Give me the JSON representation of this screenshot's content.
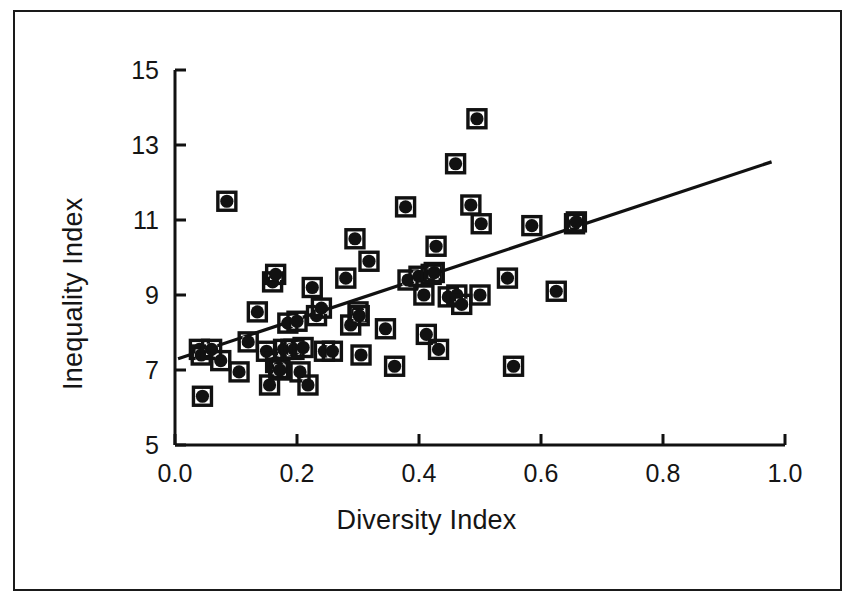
{
  "chart_data": {
    "type": "scatter",
    "title": "",
    "xlabel": "Diversity Index",
    "ylabel": "Inequality Index",
    "xlim": [
      0.0,
      1.0
    ],
    "ylim": [
      5,
      15
    ],
    "xticks": [
      "0.0",
      "0.2",
      "0.4",
      "0.6",
      "0.8",
      "1.0"
    ],
    "xtick_values": [
      0.0,
      0.2,
      0.4,
      0.6,
      0.8,
      1.0
    ],
    "yticks": [
      "5",
      "7",
      "9",
      "11",
      "13",
      "15"
    ],
    "ytick_values": [
      5,
      7,
      9,
      11,
      13,
      15
    ],
    "grid": false,
    "legend": null,
    "marker_style": "filled-circle-in-square",
    "marker_color": "#111111",
    "point_count": 62,
    "points": [
      {
        "x": 0.04,
        "y": 7.55
      },
      {
        "x": 0.043,
        "y": 7.4
      },
      {
        "x": 0.045,
        "y": 6.3
      },
      {
        "x": 0.06,
        "y": 7.55
      },
      {
        "x": 0.075,
        "y": 7.25
      },
      {
        "x": 0.085,
        "y": 11.5
      },
      {
        "x": 0.105,
        "y": 6.95
      },
      {
        "x": 0.12,
        "y": 7.75
      },
      {
        "x": 0.135,
        "y": 8.55
      },
      {
        "x": 0.15,
        "y": 7.5
      },
      {
        "x": 0.155,
        "y": 6.6
      },
      {
        "x": 0.16,
        "y": 9.35
      },
      {
        "x": 0.165,
        "y": 9.55
      },
      {
        "x": 0.165,
        "y": 7.2
      },
      {
        "x": 0.17,
        "y": 7.05
      },
      {
        "x": 0.172,
        "y": 7.0
      },
      {
        "x": 0.178,
        "y": 7.55
      },
      {
        "x": 0.185,
        "y": 8.25
      },
      {
        "x": 0.19,
        "y": 7.55
      },
      {
        "x": 0.195,
        "y": 7.55
      },
      {
        "x": 0.2,
        "y": 8.3
      },
      {
        "x": 0.205,
        "y": 6.95
      },
      {
        "x": 0.21,
        "y": 7.6
      },
      {
        "x": 0.218,
        "y": 6.6
      },
      {
        "x": 0.225,
        "y": 9.2
      },
      {
        "x": 0.232,
        "y": 8.45
      },
      {
        "x": 0.24,
        "y": 8.65
      },
      {
        "x": 0.245,
        "y": 7.5
      },
      {
        "x": 0.258,
        "y": 7.5
      },
      {
        "x": 0.28,
        "y": 9.45
      },
      {
        "x": 0.288,
        "y": 8.2
      },
      {
        "x": 0.295,
        "y": 10.5
      },
      {
        "x": 0.3,
        "y": 8.55
      },
      {
        "x": 0.302,
        "y": 8.45
      },
      {
        "x": 0.305,
        "y": 7.4
      },
      {
        "x": 0.318,
        "y": 9.9
      },
      {
        "x": 0.345,
        "y": 8.1
      },
      {
        "x": 0.36,
        "y": 7.1
      },
      {
        "x": 0.378,
        "y": 11.35
      },
      {
        "x": 0.382,
        "y": 9.4
      },
      {
        "x": 0.4,
        "y": 9.5
      },
      {
        "x": 0.408,
        "y": 9.0
      },
      {
        "x": 0.412,
        "y": 7.95
      },
      {
        "x": 0.42,
        "y": 9.55
      },
      {
        "x": 0.425,
        "y": 9.6
      },
      {
        "x": 0.428,
        "y": 10.3
      },
      {
        "x": 0.432,
        "y": 7.55
      },
      {
        "x": 0.448,
        "y": 8.95
      },
      {
        "x": 0.46,
        "y": 12.5
      },
      {
        "x": 0.462,
        "y": 9.0
      },
      {
        "x": 0.47,
        "y": 8.75
      },
      {
        "x": 0.485,
        "y": 11.4
      },
      {
        "x": 0.495,
        "y": 13.7
      },
      {
        "x": 0.5,
        "y": 9.0
      },
      {
        "x": 0.502,
        "y": 10.9
      },
      {
        "x": 0.545,
        "y": 9.45
      },
      {
        "x": 0.555,
        "y": 7.1
      },
      {
        "x": 0.585,
        "y": 10.85
      },
      {
        "x": 0.625,
        "y": 9.1
      },
      {
        "x": 0.655,
        "y": 10.9
      },
      {
        "x": 0.658,
        "y": 10.95
      }
    ],
    "trendline": {
      "type": "linear-fit",
      "x_start": 0.005,
      "y_start": 7.3,
      "x_end": 0.978,
      "y_end": 12.55,
      "slope": 5.4,
      "intercept": 7.27,
      "color": "#111111"
    }
  },
  "figure": {
    "border_color": "#1a1a1a",
    "background_color": "#ffffff",
    "axis_color": "#111111"
  }
}
